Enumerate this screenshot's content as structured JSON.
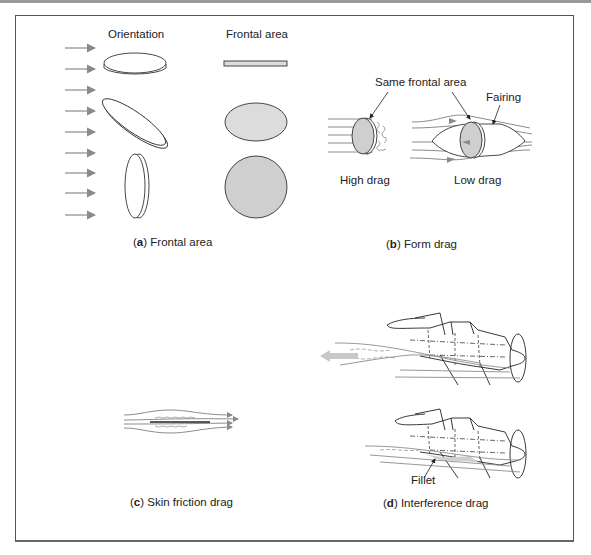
{
  "figure": {
    "panels": [
      {
        "id": "a",
        "caption_letter": "a",
        "caption_text": "Frontal area",
        "labels": {
          "orientation": "Orientation",
          "frontal_area": "Frontal area"
        }
      },
      {
        "id": "b",
        "caption_letter": "b",
        "caption_text": "Form drag",
        "labels": {
          "same_frontal_area": "Same frontal area",
          "fairing": "Fairing",
          "high_drag": "High drag",
          "low_drag": "Low drag"
        }
      },
      {
        "id": "c",
        "caption_letter": "c",
        "caption_text": "Skin friction drag"
      },
      {
        "id": "d",
        "caption_letter": "d",
        "caption_text": "Interference drag",
        "labels": {
          "fillet": "Fillet"
        }
      }
    ],
    "colors": {
      "arrow": "#8a8a8a",
      "fill_light": "#dcdcdc",
      "fill_mid": "#cfcfcf",
      "line": "#333333",
      "flow": "#8c8c8c"
    }
  }
}
